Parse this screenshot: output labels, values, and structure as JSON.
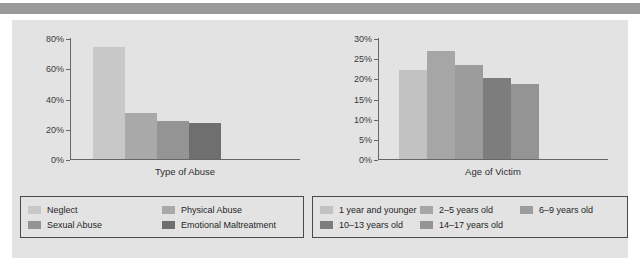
{
  "page": {
    "background": "#ffffff",
    "panel_color": "#e3e3e3",
    "top_band_color": "#9a9a9a"
  },
  "chart_data": [
    {
      "type": "bar",
      "title": "",
      "xlabel": "Type of Abuse",
      "ylabel": "",
      "categories": [
        "Neglect",
        "Physical Abuse",
        "Sexual Abuse",
        "Emotional Maltreatment"
      ],
      "values": [
        74,
        30.5,
        25,
        23.5
      ],
      "colors": [
        "#c8c8c8",
        "#a9a9a9",
        "#949494",
        "#6f6f6f"
      ],
      "ylim": [
        0,
        80
      ],
      "yticks": [
        0,
        20,
        40,
        60,
        80
      ],
      "ytick_labels": [
        "0%",
        "20%",
        "40%",
        "60%",
        "80%"
      ],
      "grid": false,
      "legend_position": "bottom-left"
    },
    {
      "type": "bar",
      "title": "",
      "xlabel": "Age of Victim",
      "ylabel": "",
      "categories": [
        "1 year and younger",
        "2–5 years old",
        "6–9 years old",
        "10–13 years old",
        "14–17 years old"
      ],
      "values": [
        22,
        26.8,
        23.4,
        20.1,
        18.6
      ],
      "colors": [
        "#c2c2c2",
        "#a6a6a6",
        "#9c9c9c",
        "#7d7d7d",
        "#949494"
      ],
      "ylim": [
        0,
        30
      ],
      "yticks": [
        0,
        5,
        10,
        15,
        20,
        25,
        30
      ],
      "ytick_labels": [
        "0%",
        "5%",
        "10%",
        "15%",
        "20%",
        "25%",
        "30%"
      ],
      "grid": false,
      "legend_position": "bottom-right"
    }
  ],
  "left_chart": {
    "xlabel": "Type of Abuse",
    "yticks": [
      {
        "label": "80%",
        "value": 80
      },
      {
        "label": "60%",
        "value": 60
      },
      {
        "label": "40%",
        "value": 40
      },
      {
        "label": "20%",
        "value": 20
      },
      {
        "label": "0%",
        "value": 0
      }
    ],
    "bars": [
      {
        "label": "Neglect",
        "value": 74,
        "color": "#c8c8c8"
      },
      {
        "label": "Physical Abuse",
        "value": 30.5,
        "color": "#a9a9a9"
      },
      {
        "label": "Sexual Abuse",
        "value": 25,
        "color": "#949494"
      },
      {
        "label": "Emotional Maltreatment",
        "value": 23.5,
        "color": "#6f6f6f"
      }
    ],
    "legend": [
      {
        "label": "Neglect",
        "color": "#c8c8c8"
      },
      {
        "label": "Physical Abuse",
        "color": "#a9a9a9"
      },
      {
        "label": "Sexual Abuse",
        "color": "#949494"
      },
      {
        "label": "Emotional Maltreatment",
        "color": "#6f6f6f"
      }
    ]
  },
  "right_chart": {
    "xlabel": "Age of Victim",
    "yticks": [
      {
        "label": "30%",
        "value": 30
      },
      {
        "label": "25%",
        "value": 25
      },
      {
        "label": "20%",
        "value": 20
      },
      {
        "label": "15%",
        "value": 15
      },
      {
        "label": "10%",
        "value": 10
      },
      {
        "label": "5%",
        "value": 5
      },
      {
        "label": "0%",
        "value": 0
      }
    ],
    "bars": [
      {
        "label": "1 year and younger",
        "value": 22,
        "color": "#c2c2c2"
      },
      {
        "label": "2–5 years old",
        "value": 26.8,
        "color": "#a6a6a6"
      },
      {
        "label": "6–9 years old",
        "value": 23.4,
        "color": "#9c9c9c"
      },
      {
        "label": "10–13 years old",
        "value": 20.1,
        "color": "#7d7d7d"
      },
      {
        "label": "14–17 years old",
        "value": 18.6,
        "color": "#949494"
      }
    ],
    "legend": [
      {
        "label": "1 year and younger",
        "color": "#c2c2c2"
      },
      {
        "label": "2–5 years old",
        "color": "#a6a6a6"
      },
      {
        "label": "6–9 years old",
        "color": "#9c9c9c"
      },
      {
        "label": "10–13 years old",
        "color": "#7d7d7d"
      },
      {
        "label": "14–17 years old",
        "color": "#949494"
      }
    ]
  }
}
